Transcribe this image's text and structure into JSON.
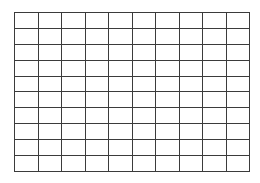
{
  "page": {
    "background_color": "#ffffff",
    "width": 260,
    "height": 183
  },
  "grid": {
    "name": "blank-grid",
    "rows": 10,
    "columns": 10,
    "total_cells": 100,
    "line_color": "#3b3b3b",
    "line_width_px": 1.6,
    "cell_fill": "#ffffff",
    "cell_width_px": 23.6,
    "cell_height_px": 16,
    "origin_x_px": 14,
    "origin_y_px": 12,
    "grid_width_px": 236,
    "grid_height_px": 160,
    "cell_text": [
      [
        "",
        "",
        "",
        "",
        "",
        "",
        "",
        "",
        "",
        ""
      ],
      [
        "",
        "",
        "",
        "",
        "",
        "",
        "",
        "",
        "",
        ""
      ],
      [
        "",
        "",
        "",
        "",
        "",
        "",
        "",
        "",
        "",
        ""
      ],
      [
        "",
        "",
        "",
        "",
        "",
        "",
        "",
        "",
        "",
        ""
      ],
      [
        "",
        "",
        "",
        "",
        "",
        "",
        "",
        "",
        "",
        ""
      ],
      [
        "",
        "",
        "",
        "",
        "",
        "",
        "",
        "",
        "",
        ""
      ],
      [
        "",
        "",
        "",
        "",
        "",
        "",
        "",
        "",
        "",
        ""
      ],
      [
        "",
        "",
        "",
        "",
        "",
        "",
        "",
        "",
        "",
        ""
      ],
      [
        "",
        "",
        "",
        "",
        "",
        "",
        "",
        "",
        "",
        ""
      ],
      [
        "",
        "",
        "",
        "",
        "",
        "",
        "",
        "",
        "",
        ""
      ]
    ]
  }
}
